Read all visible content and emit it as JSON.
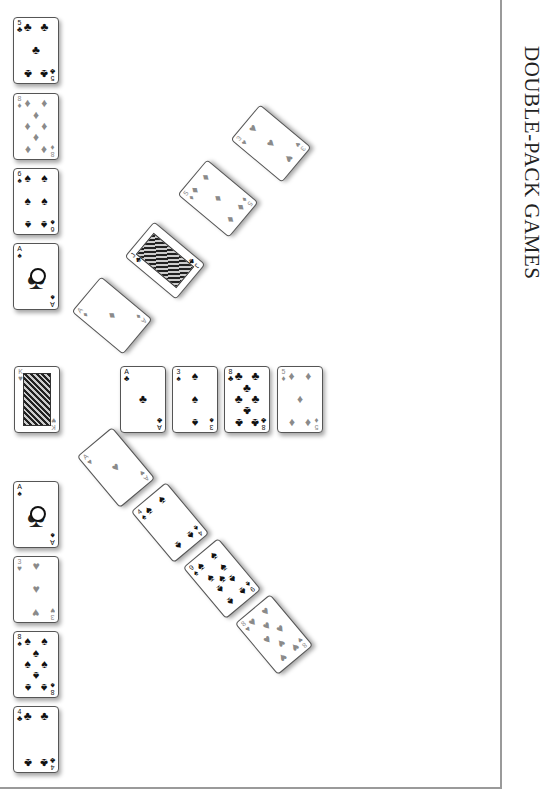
{
  "page": {
    "title": "DOUBLE-PACK GAMES",
    "frame_color": "#9a9a9a",
    "suit_colors": {
      "red": "#8a8a8a",
      "black": "#111111"
    }
  },
  "left_column_top": [
    {
      "rank": "5",
      "suit": "♣",
      "color": "black"
    },
    {
      "rank": "8",
      "suit": "♦",
      "color": "red"
    },
    {
      "rank": "6",
      "suit": "♠",
      "color": "black"
    },
    {
      "rank": "A",
      "suit": "♠",
      "color": "black"
    }
  ],
  "left_middle": {
    "rank": "K",
    "suit": "♥",
    "color": "red"
  },
  "left_column_bottom": [
    {
      "rank": "A",
      "suit": "♠",
      "color": "black"
    },
    {
      "rank": "3",
      "suit": "♥",
      "color": "red"
    },
    {
      "rank": "8",
      "suit": "♠",
      "color": "black"
    },
    {
      "rank": "4",
      "suit": "♣",
      "color": "black"
    }
  ],
  "center_row": [
    {
      "rank": "A",
      "suit": "♣",
      "color": "black"
    },
    {
      "rank": "3",
      "suit": "♠",
      "color": "black"
    },
    {
      "rank": "8",
      "suit": "♣",
      "color": "black"
    },
    {
      "rank": "5",
      "suit": "♦",
      "color": "red"
    }
  ],
  "upper_diagonal": [
    {
      "rank": "A",
      "suit": "♦",
      "color": "red"
    },
    {
      "rank": "J",
      "suit": "♣",
      "color": "black"
    },
    {
      "rank": "5",
      "suit": "♦",
      "color": "red"
    },
    {
      "rank": "3",
      "suit": "♥",
      "color": "red"
    }
  ],
  "lower_diagonal": [
    {
      "rank": "A",
      "suit": "♥",
      "color": "red"
    },
    {
      "rank": "4",
      "suit": "♠",
      "color": "black"
    },
    {
      "rank": "9",
      "suit": "♠",
      "color": "black"
    },
    {
      "rank": "8",
      "suit": "♥",
      "color": "red"
    }
  ]
}
